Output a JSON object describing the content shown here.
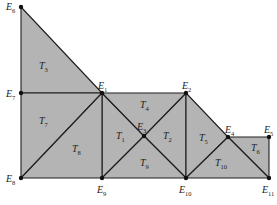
{
  "diagram": {
    "type": "triangular-mesh",
    "colors": {
      "fill": "#b4b4b4",
      "stroke": "#1e1e1e",
      "node": "#111111",
      "text": "#222222"
    },
    "nodes": [
      {
        "id": "E1",
        "name": "E",
        "sub": "1",
        "x": 102,
        "y": 93,
        "lx": 98,
        "ly": 89
      },
      {
        "id": "E2",
        "name": "E",
        "sub": "2",
        "x": 186,
        "y": 93,
        "lx": 182,
        "ly": 89
      },
      {
        "id": "E3",
        "name": "E",
        "sub": "3",
        "x": 144,
        "y": 136,
        "lx": 137,
        "ly": 130
      },
      {
        "id": "E4",
        "name": "E",
        "sub": "4",
        "x": 228,
        "y": 137,
        "lx": 225,
        "ly": 133
      },
      {
        "id": "E5",
        "name": "E",
        "sub": "5",
        "x": 269,
        "y": 137,
        "lx": 264,
        "ly": 133
      },
      {
        "id": "E6",
        "name": "E",
        "sub": "6",
        "x": 21,
        "y": 7,
        "lx": 6,
        "ly": 10
      },
      {
        "id": "E7",
        "name": "E",
        "sub": "7",
        "x": 21,
        "y": 93,
        "lx": 6,
        "ly": 97
      },
      {
        "id": "E8",
        "name": "E",
        "sub": "8",
        "x": 21,
        "y": 178,
        "lx": 6,
        "ly": 182
      },
      {
        "id": "E9",
        "name": "E",
        "sub": "9",
        "x": 102,
        "y": 178,
        "lx": 97,
        "ly": 193
      },
      {
        "id": "E10",
        "name": "E",
        "sub": "10",
        "x": 186,
        "y": 178,
        "lx": 179,
        "ly": 193
      },
      {
        "id": "E11",
        "name": "E",
        "sub": "11",
        "x": 269,
        "y": 178,
        "lx": 262,
        "ly": 193
      }
    ],
    "triangles": [
      {
        "id": "T1",
        "name": "T",
        "sub": "1",
        "vertices": [
          "E1",
          "E9",
          "E3"
        ],
        "lx": 116,
        "ly": 139
      },
      {
        "id": "T2",
        "name": "T",
        "sub": "2",
        "vertices": [
          "E2",
          "E10",
          "E3"
        ],
        "lx": 163,
        "ly": 139
      },
      {
        "id": "T3",
        "name": "T",
        "sub": "3",
        "vertices": [
          "E6",
          "E7",
          "E1"
        ],
        "lx": 39,
        "ly": 69
      },
      {
        "id": "T4",
        "name": "T",
        "sub": "4",
        "vertices": [
          "E1",
          "E2",
          "E3"
        ],
        "lx": 140,
        "ly": 108
      },
      {
        "id": "T5",
        "name": "T",
        "sub": "5",
        "vertices": [
          "E2",
          "E10",
          "E4"
        ],
        "lx": 199,
        "ly": 141
      },
      {
        "id": "T6",
        "name": "T",
        "sub": "6",
        "vertices": [
          "E4",
          "E5",
          "E11"
        ],
        "lx": 251,
        "ly": 151
      },
      {
        "id": "T7",
        "name": "T",
        "sub": "7",
        "vertices": [
          "E7",
          "E1",
          "E8"
        ],
        "lx": 39,
        "ly": 124
      },
      {
        "id": "T8",
        "name": "T",
        "sub": "8",
        "vertices": [
          "E8",
          "E1",
          "E9"
        ],
        "lx": 72,
        "ly": 152
      },
      {
        "id": "T9",
        "name": "T",
        "sub": "9",
        "vertices": [
          "E9",
          "E3",
          "E10"
        ],
        "lx": 140,
        "ly": 166
      },
      {
        "id": "T10",
        "name": "T",
        "sub": "10",
        "vertices": [
          "E10",
          "E4",
          "E11"
        ],
        "lx": 215,
        "ly": 166
      }
    ]
  }
}
